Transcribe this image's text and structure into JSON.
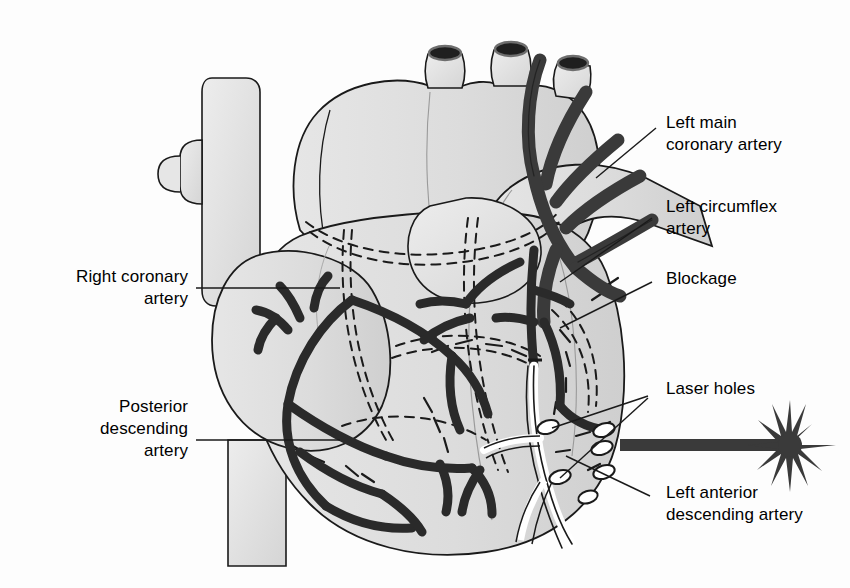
{
  "figure": {
    "type": "anatomical-diagram",
    "background_color": "#fdfdfd",
    "organ_fill": "#dcdcdc",
    "organ_fill_light": "#e8e8e8",
    "vessel_dark": "#3a3a3a",
    "outline_color": "#1a1a1a",
    "laser_color": "#3a3a3a"
  },
  "labels": {
    "left_main_coronary_artery": "Left main\ncoronary artery",
    "left_circumflex_artery": "Left circumflex\nartery",
    "blockage": "Blockage",
    "laser_holes": "Laser holes",
    "left_anterior_descending_artery": "Left anterior\ndescending artery",
    "right_coronary_artery": "Right coronary\nartery",
    "posterior_descending_artery": "Posterior\ndescending\nartery"
  },
  "structures": {
    "aorta": "aorta",
    "superior_vena_cava": "superior vena cava",
    "inferior_vena_cava": "inferior vena cava",
    "pulmonary_artery": "pulmonary artery",
    "right_atrium": "right atrium",
    "right_ventricle": "right ventricle",
    "left_ventricle": "left ventricle",
    "arch_branches": 3,
    "laser_hole_count": 6
  },
  "laser": {
    "beam_label": "laser-beam",
    "burst_label": "laser-burst",
    "beam_y": 445,
    "beam_x_start": 620,
    "beam_x_end": 790
  }
}
